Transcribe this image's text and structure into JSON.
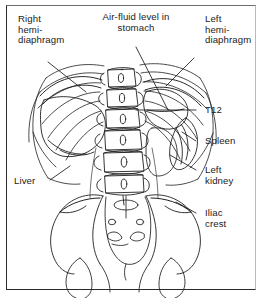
{
  "figure": {
    "background_color": "#ffffff",
    "ink_color": "#1b1b1b",
    "frame_color": "#2a2a2a"
  },
  "labels": {
    "right_hemidiaphragm": "Right\nhemi-\ndiaphragm",
    "air_fluid_level": "Air-fluid level in\nstomach",
    "left_hemidiaphragm": "Left\nhemi-\ndiaphragm",
    "t12": "T12",
    "spleen": "Spleen",
    "left_kidney": "Left\nkidney",
    "iliac_crest": "Iliac\ncrest",
    "liver": "Liver"
  },
  "anatomy_parts": [
    "vertebral-column",
    "rib-cage-right",
    "rib-cage-left",
    "right-hemidiaphragm-outline",
    "left-hemidiaphragm-outline",
    "gastric-air-fluid-level",
    "liver-shadow",
    "spleen-shadow",
    "left-kidney-outline",
    "pelvis",
    "sacrum",
    "iliac-crest-right",
    "iliac-crest-left"
  ]
}
